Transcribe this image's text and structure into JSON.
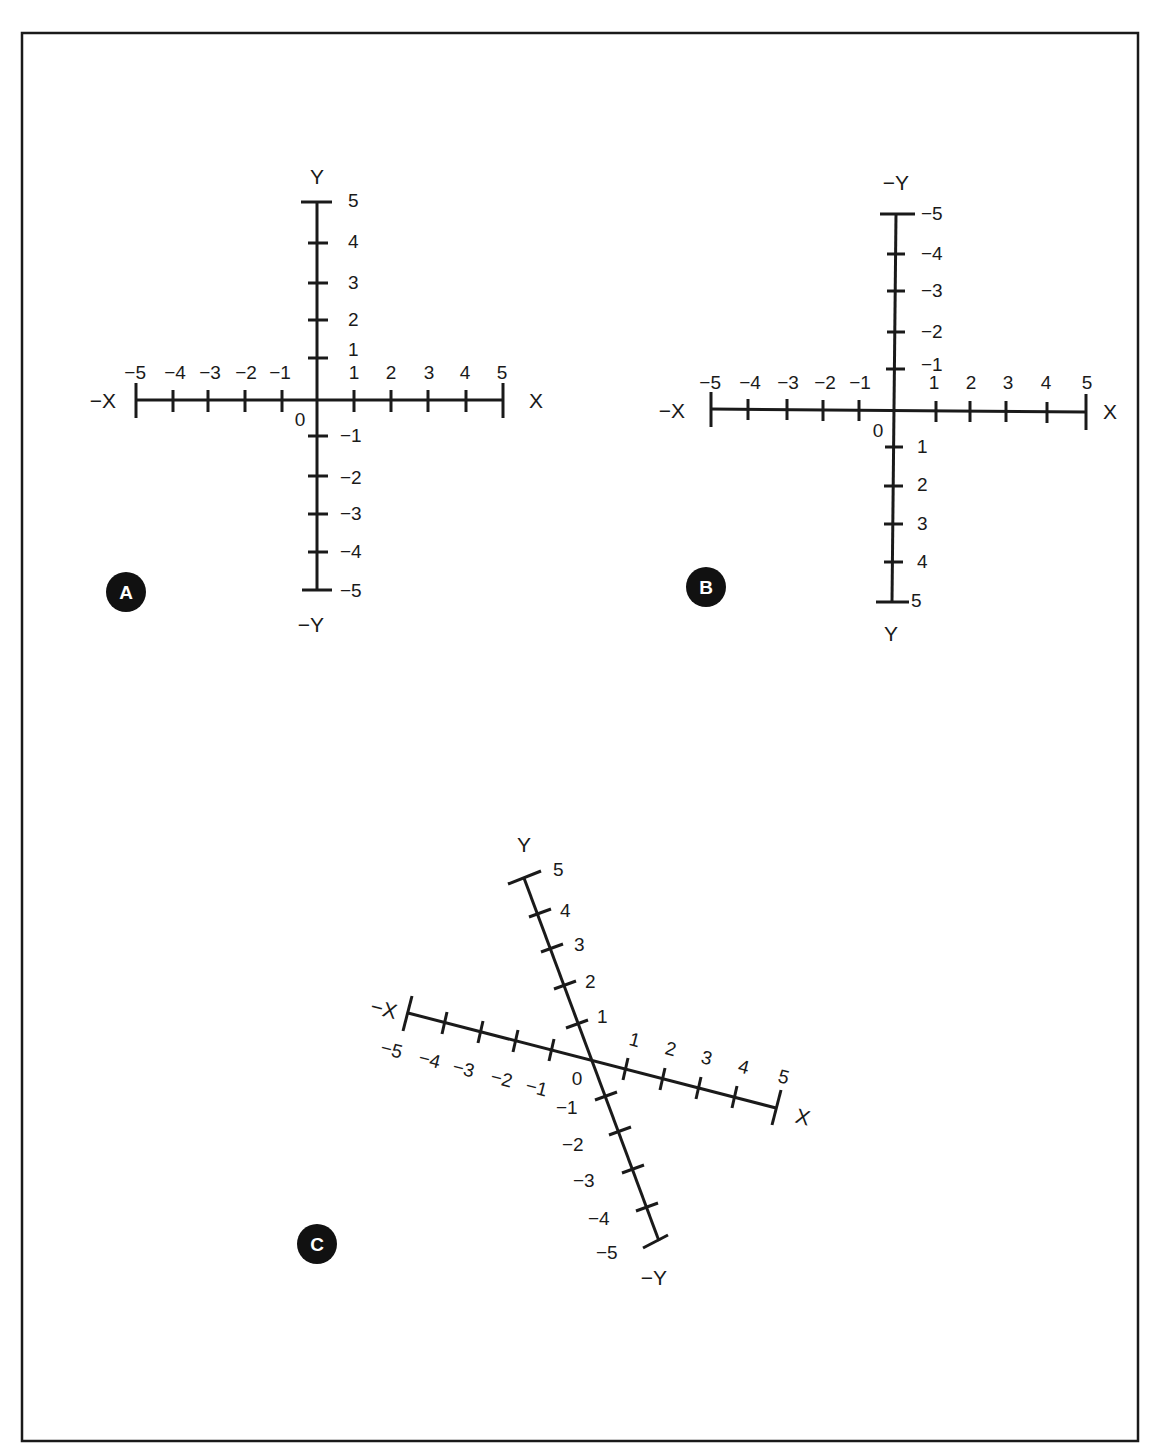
{
  "figure": {
    "frame": {
      "x": 22,
      "y": 33,
      "width": 1116,
      "height": 1408,
      "color": "#1a1a1a"
    },
    "ink_color": "#1a1a1a",
    "panels": [
      {
        "id": "A",
        "badge": "A",
        "description": "Standard Cartesian axes, Y positive upward",
        "origin": [
          317,
          400
        ],
        "x_axis": {
          "neg_label": "−X",
          "pos_label": "X",
          "ticks": [
            "−5",
            "−4",
            "−3",
            "−2",
            "−1",
            "1",
            "2",
            "3",
            "4",
            "5"
          ],
          "range": [
            -5,
            5
          ],
          "rotation_deg": 0
        },
        "y_axis": {
          "top_label": "Y",
          "bottom_label": "−Y",
          "ticks_top_to_bottom": [
            "5",
            "4",
            "3",
            "2",
            "1",
            "−1",
            "−2",
            "−3",
            "−4",
            "−5"
          ],
          "range": [
            -5,
            5
          ],
          "direction": "up-positive"
        },
        "origin_label": "0"
      },
      {
        "id": "B",
        "badge": "B",
        "description": "Axes with Y positive downward (inverted Y)",
        "origin": [
          893,
          410
        ],
        "x_axis": {
          "neg_label": "−X",
          "pos_label": "X",
          "ticks": [
            "−5",
            "−4",
            "−3",
            "−2",
            "−1",
            "1",
            "2",
            "3",
            "4",
            "5"
          ],
          "range": [
            -5,
            5
          ],
          "rotation_deg": 0
        },
        "y_axis": {
          "top_label": "−Y",
          "bottom_label": "Y",
          "ticks_top_to_bottom": [
            "−5",
            "−4",
            "−3",
            "−2",
            "−1",
            "1",
            "2",
            "3",
            "4",
            "5"
          ],
          "range": [
            -5,
            5
          ],
          "direction": "down-positive"
        },
        "origin_label": "0"
      },
      {
        "id": "C",
        "badge": "C",
        "description": "Rotated axes, X tilted about 14.5 degrees clockwise, Y tilted about 20 degrees",
        "origin": [
          592,
          1060
        ],
        "x_axis": {
          "neg_label": "−X",
          "pos_label": "X",
          "ticks": [
            "−5",
            "−4",
            "−3",
            "−2",
            "−1",
            "1",
            "2",
            "3",
            "4",
            "5"
          ],
          "range": [
            -5,
            5
          ],
          "rotation_deg": 14.5
        },
        "y_axis": {
          "top_label": "Y",
          "bottom_label": "−Y",
          "ticks_top_to_bottom": [
            "5",
            "4",
            "3",
            "2",
            "1",
            "−1",
            "−2",
            "−3",
            "−4",
            "−5"
          ],
          "range": [
            -5,
            5
          ],
          "rotation_deg": 20.4
        },
        "origin_label": "0"
      }
    ]
  }
}
